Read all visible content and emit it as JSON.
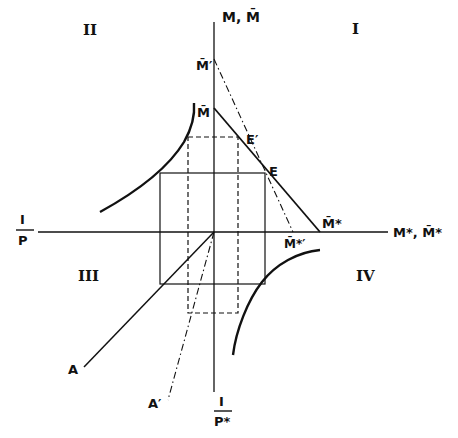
{
  "diagram": {
    "type": "four-quadrant economics diagram",
    "colors": {
      "ink": "#111111",
      "background": "#ffffff"
    },
    "axes": {
      "vertical_top_label": "M, M̄",
      "horizontal_right_label": "M*, M̄*",
      "horizontal_left_label_num": "I",
      "horizontal_left_label_den": "P",
      "vertical_bottom_label_num": "I",
      "vertical_bottom_label_den": "P*"
    },
    "quadrants": {
      "q1": "I",
      "q2": "II",
      "q3": "III",
      "q4": "IV"
    },
    "points": {
      "m_bar_prime": "M̄′",
      "m_bar": "M̄",
      "e_prime": "E′",
      "e": "E",
      "m_bar_star": "M̄*",
      "m_bar_star_prime": "M̄*′",
      "a": "A",
      "a_prime": "A′"
    }
  }
}
